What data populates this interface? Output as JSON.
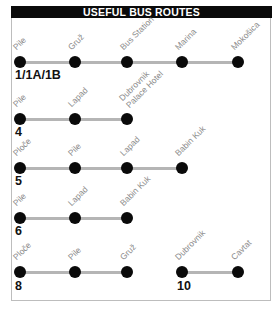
{
  "title": "USEFUL BUS ROUTES",
  "colors": {
    "title_bg": "#0a0a0a",
    "title_text": "#ffffff",
    "line": "#b5b5b5",
    "dot": "#0a0a0a",
    "stop_label": "#8a8a8a",
    "border": "#bdbdbd"
  },
  "routes": [
    {
      "number": "1/1A/1B",
      "stops": [
        "Pile",
        "Gruž",
        "Bus Station",
        "Marina",
        "Mokošica"
      ]
    },
    {
      "number": "4",
      "stops": [
        "Pile",
        "Lapad",
        "Dubrovnik Palace Hotel"
      ],
      "stop_lines": [
        [
          "Pile"
        ],
        [
          "Lapad"
        ],
        [
          "Dubrovnik",
          "Palace Hotel"
        ]
      ]
    },
    {
      "number": "5",
      "stops": [
        "Ploče",
        "Pile",
        "Lapad",
        "Babin Kuk"
      ]
    },
    {
      "number": "6",
      "stops": [
        "Pile",
        "Lapad",
        "Babin Kuk"
      ]
    },
    {
      "number": "8",
      "stops": [
        "Ploče",
        "Pile",
        "Gruž"
      ]
    },
    {
      "number": "10",
      "stops": [
        "Dubrovnik",
        "Cavtat"
      ]
    }
  ]
}
